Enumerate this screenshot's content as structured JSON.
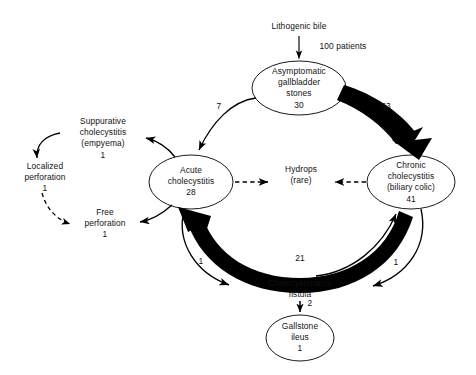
{
  "diagram": {
    "type": "flow-diagram",
    "title_text": "Lithogenic bile",
    "background_color": "#ffffff",
    "line_color": "#000000",
    "text_color": "#111111",
    "source_label": "Lithogenic bile",
    "nodes": [
      {
        "id": "asymptomatic",
        "shape": "ellipse",
        "lines": [
          "Asymptomatic",
          "gallbladder",
          "stones",
          "30"
        ],
        "count": "30",
        "cx": 299,
        "cy": 88,
        "rx": 47,
        "ry": 27
      },
      {
        "id": "acute",
        "shape": "ellipse",
        "lines": [
          "Acute",
          "cholecystitis",
          "28"
        ],
        "count": "28",
        "cx": 191,
        "cy": 182,
        "rx": 42,
        "ry": 27
      },
      {
        "id": "chronic",
        "shape": "ellipse",
        "lines": [
          "Chronic",
          "cholecystitis",
          "(biliary colic)",
          "41"
        ],
        "count": "41",
        "cx": 411,
        "cy": 182,
        "rx": 44,
        "ry": 27
      },
      {
        "id": "gallstone-ileus",
        "shape": "ellipse",
        "lines": [
          "Gallstone",
          "ileus",
          "1"
        ],
        "count": "1",
        "cx": 300,
        "cy": 338,
        "rx": 34,
        "ry": 23
      },
      {
        "id": "suppurative",
        "shape": "text",
        "lines": [
          "Suppurative",
          "cholecystitis",
          "(empyema)",
          "1"
        ],
        "count": "1",
        "cx": 103,
        "cy": 138
      },
      {
        "id": "localized-perforation",
        "shape": "text",
        "lines": [
          "Localized",
          "perforation",
          "1"
        ],
        "count": "1",
        "cx": 45,
        "cy": 178
      },
      {
        "id": "free-perforation",
        "shape": "text",
        "lines": [
          "Free",
          "perforation",
          "1"
        ],
        "count": "1",
        "cx": 105,
        "cy": 224
      },
      {
        "id": "hydrops",
        "shape": "text",
        "lines": [
          "Hydrops",
          "(rare)"
        ],
        "count": "",
        "cx": 301,
        "cy": 175
      },
      {
        "id": "fistula",
        "shape": "text",
        "lines": [
          "Cholecystenteric",
          "fistula"
        ],
        "count": "2",
        "cx": 300,
        "cy": 289
      }
    ],
    "edges": [
      {
        "id": "bile-to-asymptomatic",
        "from": "lithogenic-bile",
        "to": "asymptomatic",
        "label": "100 patients",
        "style": "solid",
        "weight": "thin"
      },
      {
        "id": "asymptomatic-to-acute",
        "from": "asymptomatic",
        "to": "acute",
        "label": "7",
        "style": "solid",
        "weight": "thin"
      },
      {
        "id": "asymptomatic-to-chronic",
        "from": "asymptomatic",
        "to": "chronic",
        "label": "63",
        "style": "solid",
        "weight": "thick"
      },
      {
        "id": "acute-to-suppurative",
        "from": "acute",
        "to": "suppurative",
        "label": "",
        "style": "solid",
        "weight": "thin"
      },
      {
        "id": "suppurative-to-localized",
        "from": "suppurative",
        "to": "localized-perforation",
        "label": "",
        "style": "solid",
        "weight": "thin"
      },
      {
        "id": "localized-to-free",
        "from": "localized-perforation",
        "to": "free-perforation",
        "label": "",
        "style": "dashed",
        "weight": "thin"
      },
      {
        "id": "acute-to-free",
        "from": "acute",
        "to": "free-perforation",
        "label": "",
        "style": "solid",
        "weight": "thin"
      },
      {
        "id": "acute-to-hydrops",
        "from": "acute",
        "to": "hydrops",
        "label": "",
        "style": "dashed",
        "weight": "thin"
      },
      {
        "id": "chronic-to-hydrops",
        "from": "chronic",
        "to": "hydrops",
        "label": "",
        "style": "dashed",
        "weight": "thin"
      },
      {
        "id": "chronic-to-acute",
        "from": "chronic",
        "to": "acute",
        "label": "21",
        "style": "solid",
        "weight": "thick"
      },
      {
        "id": "acute-to-fistula",
        "from": "acute",
        "to": "fistula",
        "label": "1",
        "style": "solid",
        "weight": "thin"
      },
      {
        "id": "chronic-to-fistula",
        "from": "chronic",
        "to": "fistula",
        "label": "1",
        "style": "solid",
        "weight": "thin"
      },
      {
        "id": "fistula-to-chronic",
        "from": "fistula",
        "to": "chronic",
        "label": "",
        "style": "solid",
        "weight": "thin"
      },
      {
        "id": "fistula-to-gallstone-ileus",
        "from": "fistula",
        "to": "gallstone-ileus",
        "label": "2",
        "style": "solid",
        "weight": "thin"
      }
    ],
    "edge_labels": {
      "patients_100": "100 patients",
      "seven": "7",
      "sixtythree": "63",
      "twentyone": "21",
      "one_left": "1",
      "one_right": "1",
      "two": "2"
    },
    "node_text": {
      "asymptomatic_l1": "Asymptomatic",
      "asymptomatic_l2": "gallbladder",
      "asymptomatic_l3": "stones",
      "asymptomatic_l4": "30",
      "acute_l1": "Acute",
      "acute_l2": "cholecystitis",
      "acute_l3": "28",
      "chronic_l1": "Chronic",
      "chronic_l2": "cholecystitis",
      "chronic_l3": "(biliary colic)",
      "chronic_l4": "41",
      "suppurative_l1": "Suppurative",
      "suppurative_l2": "cholecystitis",
      "suppurative_l3": "(empyema)",
      "suppurative_l4": "1",
      "localized_l1": "Localized",
      "localized_l2": "perforation",
      "localized_l3": "1",
      "free_l1": "Free",
      "free_l2": "perforation",
      "free_l3": "1",
      "hydrops_l1": "Hydrops",
      "hydrops_l2": "(rare)",
      "fistula_l1": "Cholecystenteric",
      "fistula_l2": "fistula",
      "ileus_l1": "Gallstone",
      "ileus_l2": "ileus",
      "ileus_l3": "1"
    }
  }
}
